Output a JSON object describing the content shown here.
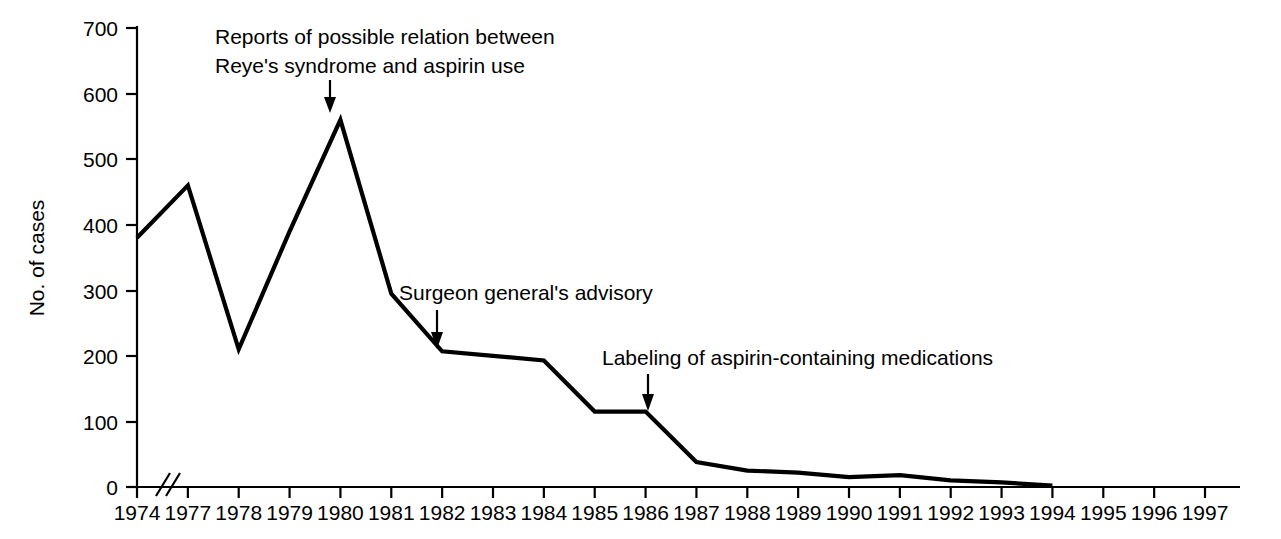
{
  "chart_data": {
    "type": "line",
    "title": "",
    "xlabel": "",
    "ylabel": "No. of cases",
    "ylim": [
      0,
      700
    ],
    "ytick_values": [
      0,
      100,
      200,
      300,
      400,
      500,
      600,
      700
    ],
    "ytick_labels": [
      "0",
      "100",
      "200",
      "300",
      "400",
      "500",
      "600",
      "700"
    ],
    "grid": false,
    "legend": "none",
    "axis_break": {
      "axis": "x",
      "symbol": "//",
      "between": [
        "1974",
        "1977"
      ]
    },
    "xtick_labels": [
      "1974",
      "1977",
      "1978",
      "1979",
      "1980",
      "1981",
      "1982",
      "1983",
      "1984",
      "1985",
      "1986",
      "1987",
      "1988",
      "1989",
      "1990",
      "1991",
      "1992",
      "1993",
      "1994",
      "1995",
      "1996",
      "1997"
    ],
    "x": [
      1974,
      1977,
      1978,
      1979,
      1980,
      1981,
      1982,
      1983,
      1984,
      1985,
      1986,
      1987,
      1988,
      1989,
      1990,
      1991,
      1992,
      1993,
      1994
    ],
    "values": [
      380,
      460,
      210,
      390,
      560,
      295,
      207,
      200,
      193,
      115,
      115,
      38,
      25,
      22,
      15,
      18,
      10,
      7,
      2
    ],
    "series": [
      {
        "name": "Reye's syndrome cases",
        "values": [
          380,
          460,
          210,
          390,
          560,
          295,
          207,
          200,
          193,
          115,
          115,
          38,
          25,
          22,
          15,
          18,
          10,
          7,
          2
        ]
      }
    ],
    "annotations": [
      {
        "id": "reports-annotation",
        "lines": [
          "Reports of possible relation between",
          "Reye's syndrome and aspirin use"
        ],
        "points_to_year": 1980,
        "points_to_value": 560
      },
      {
        "id": "surgeon-general-annotation",
        "lines": [
          "Surgeon general's advisory"
        ],
        "points_to_year": 1982,
        "points_to_value": 207
      },
      {
        "id": "labeling-annotation",
        "lines": [
          "Labeling of aspirin-containing medications"
        ],
        "points_to_year": 1986,
        "points_to_value": 115
      }
    ]
  },
  "axes": {
    "y_axis_label": "No. of cases",
    "y_ticks": [
      "700",
      "600",
      "500",
      "400",
      "300",
      "200",
      "100",
      "0"
    ],
    "x_ticks": [
      "1974",
      "1977",
      "1978",
      "1979",
      "1980",
      "1981",
      "1982",
      "1983",
      "1984",
      "1985",
      "1986",
      "1987",
      "1988",
      "1989",
      "1990",
      "1991",
      "1992",
      "1993",
      "1994",
      "1995",
      "1996",
      "1997"
    ]
  },
  "annotations": {
    "reports_line1": "Reports of possible relation between",
    "reports_line2": "Reye's syndrome and aspirin use",
    "surgeon_general": "Surgeon general's advisory",
    "labeling": "Labeling of aspirin-containing medications"
  },
  "colors": {
    "line": "#000000",
    "axis": "#000000",
    "background": "#ffffff",
    "text": "#000000"
  }
}
